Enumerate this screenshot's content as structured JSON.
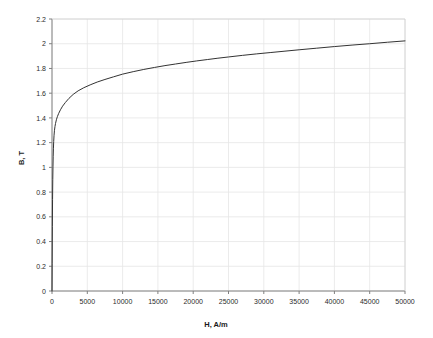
{
  "chart_data": {
    "type": "line",
    "title": "",
    "subtitle": "",
    "xlabel": "H, A/m",
    "ylabel": "B, T",
    "xlim": [
      0,
      50000
    ],
    "ylim": [
      0,
      2.2
    ],
    "grid": true,
    "legend": null,
    "legend_position": "none",
    "xticks": [
      0,
      5000,
      10000,
      15000,
      20000,
      25000,
      30000,
      35000,
      40000,
      45000,
      50000
    ],
    "xtick_labels": [
      "0",
      "5000",
      "10000",
      "15000",
      "20000",
      "25000",
      "30000",
      "35000",
      "40000",
      "45000",
      "50000"
    ],
    "yticks": [
      0,
      0.2,
      0.4,
      0.6,
      0.8,
      1,
      1.2,
      1.4,
      1.6,
      1.8,
      2,
      2.2
    ],
    "ytick_labels": [
      "0",
      "0.2",
      "0.4",
      "0.6",
      "0.8",
      "1",
      "1.2",
      "1.4",
      "1.6",
      "1.8",
      "2",
      "2.2"
    ],
    "series": [
      {
        "name": "B-H curve",
        "color": "#333333",
        "line_width": 1,
        "x": [
          0,
          20,
          50,
          80,
          110,
          140,
          170,
          200,
          240,
          290,
          350,
          420,
          500,
          620,
          760,
          950,
          1200,
          1500,
          1900,
          2400,
          3000,
          3700,
          4500,
          5400,
          6400,
          7500,
          8700,
          10000,
          11500,
          13000,
          14500,
          16000,
          17500,
          19000,
          20500,
          22000,
          23500,
          25000,
          27000,
          29000,
          31000,
          33000,
          35000,
          37500,
          40000,
          42500,
          45000,
          47500,
          50000
        ],
        "y": [
          0,
          0.22,
          0.52,
          0.74,
          0.9,
          1.01,
          1.09,
          1.15,
          1.21,
          1.26,
          1.3,
          1.33,
          1.355,
          1.385,
          1.41,
          1.437,
          1.466,
          1.495,
          1.525,
          1.558,
          1.59,
          1.619,
          1.644,
          1.667,
          1.69,
          1.711,
          1.732,
          1.754,
          1.774,
          1.792,
          1.808,
          1.823,
          1.836,
          1.849,
          1.861,
          1.872,
          1.883,
          1.893,
          1.906,
          1.918,
          1.929,
          1.94,
          1.951,
          1.964,
          1.977,
          1.989,
          2.0,
          2.012,
          2.023
        ]
      }
    ]
  },
  "axes": {
    "y_axis_title": "B, T",
    "x_axis_title": "H, A/m"
  }
}
